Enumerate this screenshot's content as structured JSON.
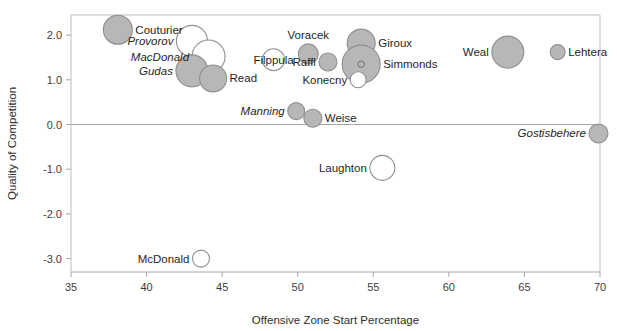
{
  "chart_data": {
    "type": "scatter",
    "title": "",
    "xlabel": "Offensive Zone Start Percentage",
    "ylabel": "Quality of Competition",
    "xlim": [
      35,
      70
    ],
    "ylim": [
      -3.3,
      2.45
    ],
    "xticks": [
      "35",
      "40",
      "45",
      "50",
      "55",
      "60",
      "65",
      "70"
    ],
    "xtick_values": [
      35,
      40,
      45,
      50,
      55,
      60,
      65,
      70
    ],
    "yticks": [
      "2.0",
      "1.0",
      "0.0",
      "-1.0",
      "-2.0",
      "-3.0"
    ],
    "ytick_values": [
      2.0,
      1.0,
      0.0,
      -1.0,
      -2.0,
      -3.0
    ],
    "grid": false,
    "legend": "none",
    "marker_fill": "#b7b7b7",
    "marker_stroke": "#8f8f8f",
    "zero_line_y": 0.0,
    "points": [
      {
        "label": "Couturier",
        "x": 38.1,
        "y": 2.12,
        "size": 14.5,
        "filled": true,
        "italic": false,
        "label_pos": "right"
      },
      {
        "label": "Provorov",
        "x": 43.0,
        "y": 1.87,
        "size": 15.5,
        "filled": false,
        "italic": true,
        "label_pos": "left"
      },
      {
        "label": "MacDonald",
        "x": 44.1,
        "y": 1.52,
        "size": 16.5,
        "filled": false,
        "italic": true,
        "label_pos": "left"
      },
      {
        "label": "Gudas",
        "x": 43.0,
        "y": 1.2,
        "size": 16.0,
        "filled": true,
        "italic": true,
        "label_pos": "left"
      },
      {
        "label": "Read",
        "x": 44.4,
        "y": 1.03,
        "size": 13.5,
        "filled": true,
        "italic": false,
        "label_pos": "right"
      },
      {
        "label": "Filppula",
        "x": 48.4,
        "y": 1.45,
        "size": 11.0,
        "filled": false,
        "italic": false,
        "label_pos": "center"
      },
      {
        "label": "Voracek",
        "x": 50.7,
        "y": 1.58,
        "size": 10.0,
        "filled": true,
        "italic": false,
        "label_pos": "above"
      },
      {
        "label": "Raffl",
        "x": 52.0,
        "y": 1.4,
        "size": 9.0,
        "filled": true,
        "italic": false,
        "label_pos": "left"
      },
      {
        "label": "Giroux",
        "x": 54.2,
        "y": 1.82,
        "size": 14.0,
        "filled": true,
        "italic": false,
        "label_pos": "right"
      },
      {
        "label": "Simmonds",
        "x": 54.2,
        "y": 1.35,
        "size": 19.0,
        "filled": true,
        "italic": false,
        "label_pos": "right",
        "inner_dot": 3.2
      },
      {
        "label": "Konecny",
        "x": 54.0,
        "y": 1.0,
        "size": 8.0,
        "filled": false,
        "italic": false,
        "label_pos": "left"
      },
      {
        "label": "Weal",
        "x": 63.9,
        "y": 1.62,
        "size": 16.0,
        "filled": true,
        "italic": false,
        "label_pos": "left"
      },
      {
        "label": "Lehtera",
        "x": 67.2,
        "y": 1.62,
        "size": 7.5,
        "filled": true,
        "italic": false,
        "label_pos": "right"
      },
      {
        "label": "Manning",
        "x": 49.9,
        "y": 0.3,
        "size": 8.5,
        "filled": true,
        "italic": true,
        "label_pos": "left"
      },
      {
        "label": "Weise",
        "x": 51.0,
        "y": 0.14,
        "size": 9.0,
        "filled": true,
        "italic": false,
        "label_pos": "right"
      },
      {
        "label": "Gostisbehere",
        "x": 69.9,
        "y": -0.2,
        "size": 9.5,
        "filled": true,
        "italic": true,
        "label_pos": "left"
      },
      {
        "label": "Laughton",
        "x": 55.6,
        "y": -0.97,
        "size": 12.5,
        "filled": false,
        "italic": false,
        "label_pos": "left"
      },
      {
        "label": "McDonald",
        "x": 43.6,
        "y": -3.0,
        "size": 8.5,
        "filled": false,
        "italic": false,
        "label_pos": "left"
      }
    ]
  }
}
